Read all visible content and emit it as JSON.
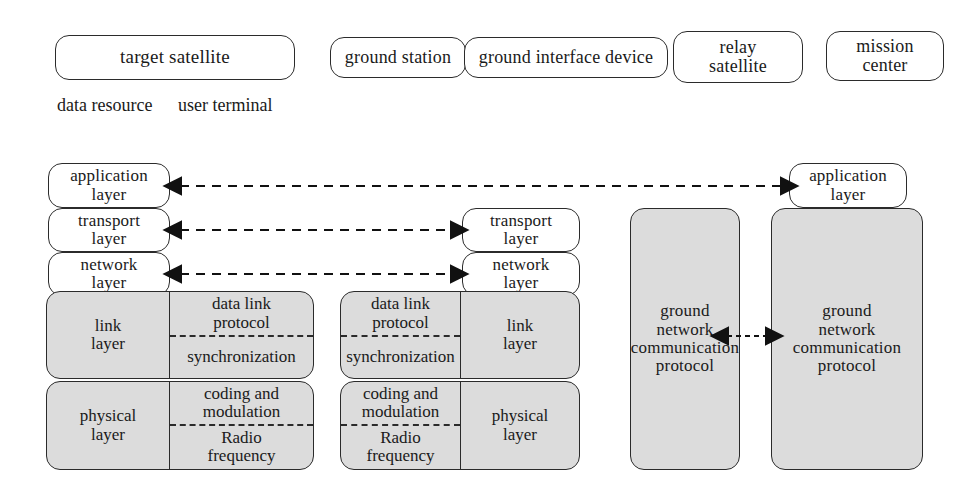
{
  "legend": {
    "items": [
      {
        "id": "target-satellite",
        "label": "target satellite"
      },
      {
        "id": "ground-station",
        "label": "ground station"
      },
      {
        "id": "ground-interface-device",
        "label": "ground interface device"
      },
      {
        "id": "relay-satellite",
        "label": "relay\nsatellite",
        "line1": "relay",
        "line2": "satellite"
      },
      {
        "id": "mission-center",
        "label": "mission\ncenter",
        "line1": "mission",
        "line2": "center"
      }
    ],
    "plain_labels": [
      {
        "id": "data-resource",
        "label": "data resource"
      },
      {
        "id": "user-terminal",
        "label": "user terminal"
      }
    ]
  },
  "stacks": {
    "left": {
      "name": "target satellite stack",
      "application_layer": {
        "line1": "application",
        "line2": "layer"
      },
      "transport_layer": {
        "line1": "transport",
        "line2": "layer"
      },
      "network_layer": {
        "line1": "network",
        "line2": "layer"
      },
      "link_layer": {
        "main": {
          "line1": "link",
          "line2": "layer"
        },
        "detail_top": {
          "line1": "data link",
          "line2": "protocol"
        },
        "detail_bottom": {
          "line1": "synchronization"
        }
      },
      "physical_layer": {
        "main": {
          "line1": "physical",
          "line2": "layer"
        },
        "detail_top": {
          "line1": "coding and",
          "line2": "modulation"
        },
        "detail_bottom": {
          "line1": "Radio",
          "line2": "frequency"
        }
      }
    },
    "middle": {
      "name": "ground station stack",
      "transport_layer": {
        "line1": "transport",
        "line2": "layer"
      },
      "network_layer": {
        "line1": "network",
        "line2": "layer"
      },
      "link_layer": {
        "main": {
          "line1": "link",
          "line2": "layer"
        },
        "detail_top": {
          "line1": "data link",
          "line2": "protocol"
        },
        "detail_bottom": {
          "line1": "synchronization"
        }
      },
      "physical_layer": {
        "main": {
          "line1": "physical",
          "line2": "layer"
        },
        "detail_top": {
          "line1": "coding and",
          "line2": "modulation"
        },
        "detail_bottom": {
          "line1": "Radio",
          "line2": "frequency"
        }
      }
    },
    "ground_network_left": {
      "name": "ground interface device network protocol",
      "line1": "ground",
      "line2": "network",
      "line3": "communication",
      "line4": "protocol"
    },
    "right": {
      "name": "mission center stack",
      "application_layer": {
        "line1": "application",
        "line2": "layer"
      },
      "ground_network": {
        "line1": "ground",
        "line2": "network",
        "line3": "communication",
        "line4": "protocol"
      }
    }
  },
  "connectors": [
    {
      "id": "application-layer-link",
      "from": "left.application_layer",
      "to": "right.application_layer",
      "style": "dashed",
      "heads": "both"
    },
    {
      "id": "transport-layer-link",
      "from": "left.transport_layer",
      "to": "middle.transport_layer",
      "style": "dashed",
      "heads": "both"
    },
    {
      "id": "network-layer-link",
      "from": "left.network_layer",
      "to": "middle.network_layer",
      "style": "dashed",
      "heads": "both"
    },
    {
      "id": "ground-network-link",
      "from": "ground_network_left",
      "to": "right.ground_network",
      "style": "dashed",
      "heads": "both"
    }
  ],
  "colors": {
    "shaded_fill": "#dcdcdc",
    "white_fill": "#ffffff",
    "stroke": "#2b2b2b",
    "background": "#ffffff"
  }
}
